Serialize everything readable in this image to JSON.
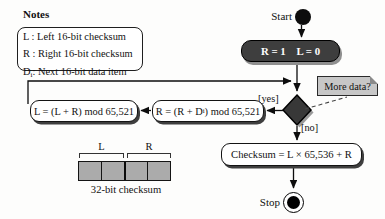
{
  "colors": {
    "dark_node_fill": "#3e3e3e",
    "node_text": "#ffffff",
    "note_fill": "#c7c7c7",
    "cell_fill": "#ababab",
    "line": "#111111",
    "shadow": "#3f3f3f"
  },
  "notes": {
    "title": "Notes",
    "legend": [
      {
        "pre": "L : Left 16-bit checksum",
        "sub": "",
        "post": ""
      },
      {
        "pre": "R : Right 16-bit checksum",
        "sub": "",
        "post": ""
      },
      {
        "pre": "D",
        "sub": "i",
        "post": ": Next 16-bit data item"
      }
    ]
  },
  "flow": {
    "start_label": "Start",
    "init_label": "R = 1    L = 0",
    "more_data_note": "More data?",
    "yes_label": "[yes]",
    "no_label": "[no]",
    "update_r": {
      "pre": "R = (R + D",
      "sub": "i",
      "post": ") mod 65,521"
    },
    "update_l": "L = (L + R) mod 65,521",
    "final_label": "Checksum = L × 65,536 + R",
    "stop_label": "Stop"
  },
  "checksum_diagram": {
    "left_label": "L",
    "right_label": "R",
    "caption": "32-bit checksum",
    "cells": 4
  }
}
